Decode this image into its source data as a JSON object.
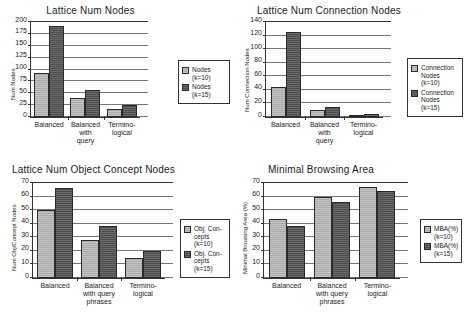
{
  "figure": {
    "panel_count": 4,
    "series_colors": {
      "k10": "#ababab",
      "k15": "#4d4d4d"
    },
    "axis_color": "#333333"
  },
  "chart_data": [
    {
      "type": "bar",
      "title": "Lattice Num Nodes",
      "xlabel": "",
      "ylabel": "Num Nodes",
      "categories": [
        "Balanced",
        "Balanced with query",
        "Termino- logical"
      ],
      "category_lines": [
        [
          "Balanced"
        ],
        [
          "Balanced",
          "with",
          "query"
        ],
        [
          "Termino-",
          "logical"
        ]
      ],
      "series": [
        {
          "name": "Nodes (k=10)",
          "values": [
            93,
            41,
            17
          ]
        },
        {
          "name": "Nodes (k=15)",
          "values": [
            192,
            56,
            26
          ]
        }
      ],
      "ylim": [
        0,
        200
      ],
      "yticks": [
        0,
        25,
        50,
        75,
        100,
        125,
        150,
        175,
        200
      ],
      "grid": true,
      "legend_position": "right"
    },
    {
      "type": "bar",
      "title": "Lattice Num Connection Nodes",
      "xlabel": "",
      "ylabel": "Num Connection Nodes",
      "categories": [
        "Balanced",
        "Balanced with query",
        "Termino- logical"
      ],
      "category_lines": [
        [
          "Balanced"
        ],
        [
          "Balanced",
          "with",
          "query"
        ],
        [
          "Termino-",
          "logical"
        ]
      ],
      "series": [
        {
          "name": "Connection Nodes (k=10)",
          "values": [
            44,
            11,
            3
          ]
        },
        {
          "name": "Connection Nodes (k=15)",
          "values": [
            125,
            15,
            4
          ]
        }
      ],
      "ylim": [
        0,
        140
      ],
      "yticks": [
        0,
        20,
        40,
        60,
        80,
        100,
        120,
        140
      ],
      "grid": true,
      "legend_position": "right"
    },
    {
      "type": "bar",
      "title": "Lattice Num Object Concept Nodes",
      "xlabel": "",
      "ylabel": "Num Obj/Concept Nodes",
      "categories": [
        "Balanced",
        "Balanced with query phrases",
        "Termino- logical"
      ],
      "category_lines": [
        [
          "Balanced"
        ],
        [
          "Balanced",
          "with query",
          "phrases"
        ],
        [
          "Termino-",
          "logical"
        ]
      ],
      "series": [
        {
          "name": "Obj. Con- cepts (k=10)",
          "values": [
            50,
            28,
            14.5
          ]
        },
        {
          "name": "Obj. Con- cepts (k=15)",
          "values": [
            66,
            38,
            20
          ]
        }
      ],
      "ylim": [
        0,
        70
      ],
      "yticks": [
        0,
        10,
        20,
        30,
        40,
        50,
        60,
        70
      ],
      "grid": true,
      "legend_position": "right"
    },
    {
      "type": "bar",
      "title": "Minimal Browsing Area",
      "xlabel": "",
      "ylabel": "Minimal Browsing Area (%)",
      "categories": [
        "Balanced",
        "Balanced with query phrases",
        "Termino- logical"
      ],
      "category_lines": [
        [
          "Balanced"
        ],
        [
          "Balanced",
          "with query",
          "phrases"
        ],
        [
          "Termino-",
          "logical"
        ]
      ],
      "series": [
        {
          "name": "MBA(%) (k=10)",
          "values": [
            43.5,
            60,
            67
          ]
        },
        {
          "name": "MBA(%) (k=15)",
          "values": [
            38.5,
            56,
            64
          ]
        }
      ],
      "ylim": [
        0,
        70
      ],
      "yticks": [
        0,
        10,
        20,
        30,
        40,
        50,
        60,
        70
      ],
      "grid": true,
      "legend_position": "right"
    }
  ],
  "legends": [
    {
      "rows": [
        [
          "Nodes (k=10)"
        ],
        [
          "Nodes (k=15)"
        ]
      ]
    },
    {
      "rows": [
        [
          "Connection",
          "Nodes (k=10)"
        ],
        [
          "Connection",
          "Nodes (k=15)"
        ]
      ]
    },
    {
      "rows": [
        [
          "Obj. Con-",
          "cepts (k=10)"
        ],
        [
          "Obj. Con-",
          "cepts (k=15)"
        ]
      ]
    },
    {
      "rows": [
        [
          "MBA(%)",
          "(k=10)"
        ],
        [
          "MBA(%)",
          "(k=15)"
        ]
      ]
    }
  ]
}
